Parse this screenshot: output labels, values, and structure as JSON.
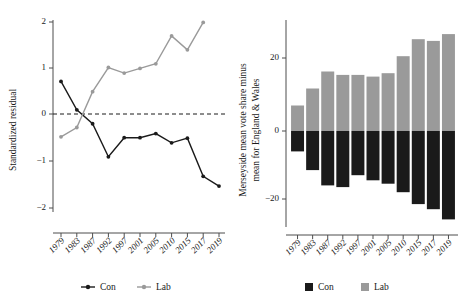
{
  "figure": {
    "width": 461,
    "height": 303,
    "background": "#ffffff"
  },
  "colors": {
    "con": "#1a1a1a",
    "lab": "#9a9a9a",
    "axis": "#4d4d4d",
    "text": "#1a1a1a"
  },
  "chart_data": [
    {
      "id": "left",
      "type": "line",
      "title": "",
      "xlabel": "",
      "ylabel": "Standardized residual",
      "categories": [
        "1979",
        "1983",
        "1987",
        "1992",
        "1997",
        "2001",
        "2005",
        "2010",
        "2015",
        "2017",
        "2019"
      ],
      "yticks": [
        2,
        1,
        0,
        -1,
        -2
      ],
      "ytick_labels": [
        "2",
        "1",
        "0",
        "−1",
        "−2"
      ],
      "ylim": [
        -2.25,
        2.15
      ],
      "grid": false,
      "reference_line": {
        "y": 0,
        "style": "dashed"
      },
      "legend": {
        "position": "bottom",
        "entries": [
          "Con",
          "Lab"
        ]
      },
      "series": [
        {
          "name": "Con",
          "color": "#1a1a1a",
          "marker": "circle",
          "values": [
            0.7,
            0.09,
            -0.21,
            -0.92,
            -0.51,
            -0.51,
            -0.42,
            -0.62,
            -0.52,
            -1.34,
            -1.55
          ]
        },
        {
          "name": "Lab",
          "color": "#9a9a9a",
          "marker": "circle",
          "values": [
            -0.49,
            -0.29,
            0.48,
            1.0,
            0.88,
            0.98,
            1.08,
            1.68,
            1.38,
            1.97,
            null
          ]
        }
      ]
    },
    {
      "id": "right",
      "type": "bar",
      "title": "",
      "xlabel": "",
      "ylabel": "Merseyside mean vote share minus mean for England & Wales",
      "ylabel_lines": [
        "Merseyside mean vote share minus",
        "mean for England & Wales"
      ],
      "categories": [
        "1979",
        "1983",
        "1987",
        "1992",
        "1997",
        "2001",
        "2005",
        "2010",
        "2015",
        "2017",
        "2019"
      ],
      "yticks": [
        20,
        0,
        -20
      ],
      "ytick_labels": [
        "20",
        "0",
        "−20"
      ],
      "ylim": [
        -30,
        31
      ],
      "grid": false,
      "legend": {
        "position": "bottom",
        "entries": [
          "Con",
          "Lab"
        ]
      },
      "series": [
        {
          "name": "Con",
          "color": "#1a1a1a",
          "values": [
            -6.0,
            -11.5,
            -16.0,
            -16.5,
            -13.0,
            -14.5,
            -15.5,
            -18.0,
            -21.5,
            -23.0,
            -26.0
          ]
        },
        {
          "name": "Lab",
          "color": "#9a9a9a",
          "values": [
            7.5,
            12.5,
            17.5,
            16.5,
            16.5,
            16.0,
            17.0,
            22.0,
            27.0,
            26.5,
            28.5
          ]
        }
      ]
    }
  ]
}
